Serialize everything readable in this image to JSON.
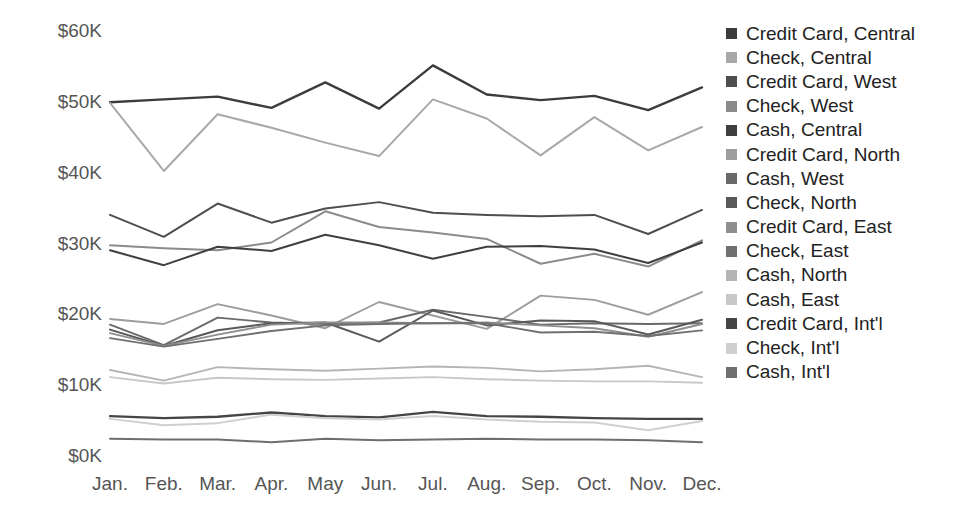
{
  "chart_data": {
    "type": "line",
    "title": "",
    "xlabel": "",
    "ylabel": "",
    "categories": [
      "Jan.",
      "Feb.",
      "Mar.",
      "Apr.",
      "May",
      "Jun.",
      "Jul.",
      "Aug.",
      "Sep.",
      "Oct.",
      "Nov.",
      "Dec."
    ],
    "ylim": [
      0,
      60000
    ],
    "yticks": [
      0,
      10000,
      20000,
      30000,
      40000,
      50000,
      60000
    ],
    "ytick_labels": [
      "$0K",
      "$10K",
      "$20K",
      "$30K",
      "$40K",
      "$50K",
      "$60K"
    ],
    "grid": false,
    "legend_position": "right",
    "value_prefix": "$",
    "value_suffix": "K",
    "series": [
      {
        "name": "Credit Card, Central",
        "color": "#3c3c3c",
        "width": 2.4,
        "values": [
          49800,
          50200,
          50600,
          49000,
          52600,
          48900,
          55000,
          50900,
          50100,
          50700,
          48700,
          51900
        ]
      },
      {
        "name": "Check, Central",
        "color": "#a8a8a8",
        "width": 2.0,
        "values": [
          49700,
          40100,
          48100,
          46200,
          44100,
          42200,
          50200,
          47500,
          42300,
          47700,
          43000,
          46300
        ]
      },
      {
        "name": "Credit Card, West",
        "color": "#4e4e4e",
        "width": 2.0,
        "values": [
          33900,
          30800,
          35500,
          32800,
          34800,
          35700,
          34200,
          33900,
          33700,
          33900,
          31200,
          34600
        ]
      },
      {
        "name": "Check, West",
        "color": "#8b8b8b",
        "width": 2.0,
        "values": [
          29600,
          29200,
          28900,
          30000,
          34400,
          32200,
          31400,
          30500,
          27000,
          28400,
          26600,
          30300
        ]
      },
      {
        "name": "Cash, Central",
        "color": "#3f3f3f",
        "width": 2.0,
        "values": [
          28900,
          26800,
          29400,
          28800,
          31100,
          29600,
          27700,
          29400,
          29500,
          29000,
          27100,
          30000
        ]
      },
      {
        "name": "Credit Card, North",
        "color": "#9d9d9d",
        "width": 1.9,
        "values": [
          19200,
          18500,
          21300,
          19700,
          17900,
          21600,
          19700,
          17800,
          22500,
          21900,
          19800,
          23000
        ]
      },
      {
        "name": "Cash, West",
        "color": "#6a6a6a",
        "width": 1.9,
        "values": [
          18400,
          15500,
          19400,
          18700,
          18500,
          18700,
          20500,
          19500,
          18400,
          18600,
          18500,
          18600
        ]
      },
      {
        "name": "Check, North",
        "color": "#595959",
        "width": 2.0,
        "values": [
          17700,
          15400,
          17600,
          18600,
          18700,
          16000,
          20400,
          18300,
          19000,
          18900,
          17000,
          19100
        ]
      },
      {
        "name": "Credit Card, East",
        "color": "#8e8e8e",
        "width": 1.9,
        "values": [
          17200,
          15400,
          17000,
          18400,
          18700,
          18700,
          18600,
          18700,
          18300,
          17900,
          16700,
          18500
        ]
      },
      {
        "name": "Check, East",
        "color": "#707070",
        "width": 1.9,
        "values": [
          16500,
          15300,
          16400,
          17500,
          18300,
          18500,
          18600,
          18600,
          17300,
          17400,
          16800,
          17600
        ]
      },
      {
        "name": "Cash, North",
        "color": "#b5b5b5",
        "width": 1.9,
        "values": [
          12000,
          10500,
          12400,
          12100,
          11900,
          12200,
          12500,
          12300,
          11800,
          12100,
          12600,
          11000
        ]
      },
      {
        "name": "Cash, East",
        "color": "#c8c8c8",
        "width": 1.9,
        "values": [
          11000,
          10100,
          10900,
          10700,
          10600,
          10800,
          11000,
          10700,
          10500,
          10400,
          10400,
          10200
        ]
      },
      {
        "name": "Credit Card, Int'l",
        "color": "#454545",
        "width": 2.3,
        "values": [
          5500,
          5200,
          5400,
          6000,
          5500,
          5300,
          6100,
          5500,
          5400,
          5200,
          5100,
          5100
        ]
      },
      {
        "name": "Check, Int'l",
        "color": "#cfcfcf",
        "width": 2.0,
        "values": [
          5100,
          4200,
          4500,
          5700,
          5200,
          5000,
          5500,
          5000,
          4700,
          4600,
          3500,
          4800
        ]
      },
      {
        "name": "Cash, Int'l",
        "color": "#6e6e6e",
        "width": 2.0,
        "values": [
          2300,
          2200,
          2200,
          1800,
          2300,
          2100,
          2200,
          2300,
          2200,
          2200,
          2100,
          1800
        ]
      }
    ]
  },
  "legend": {
    "items": [
      {
        "label": "Credit Card, Central",
        "color": "#3c3c3c"
      },
      {
        "label": "Check, Central",
        "color": "#a8a8a8"
      },
      {
        "label": "Credit Card, West",
        "color": "#4e4e4e"
      },
      {
        "label": "Check, West",
        "color": "#8b8b8b"
      },
      {
        "label": "Cash, Central",
        "color": "#3f3f3f"
      },
      {
        "label": "Credit Card, North",
        "color": "#9d9d9d"
      },
      {
        "label": "Cash, West",
        "color": "#6a6a6a"
      },
      {
        "label": "Check, North",
        "color": "#595959"
      },
      {
        "label": "Credit Card, East",
        "color": "#8e8e8e"
      },
      {
        "label": "Check, East",
        "color": "#707070"
      },
      {
        "label": "Cash, North",
        "color": "#b5b5b5"
      },
      {
        "label": "Cash, East",
        "color": "#c8c8c8"
      },
      {
        "label": "Credit Card, Int'l",
        "color": "#454545"
      },
      {
        "label": "Check, Int'l",
        "color": "#cfcfcf"
      },
      {
        "label": "Cash, Int'l",
        "color": "#6e6e6e"
      }
    ]
  }
}
